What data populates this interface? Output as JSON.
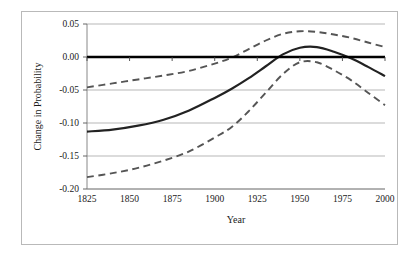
{
  "chart_data": {
    "type": "line",
    "title": "",
    "xlabel": "Year",
    "ylabel": "Change in Probability",
    "xlim": [
      1825,
      2000
    ],
    "ylim": [
      -0.2,
      0.05
    ],
    "grid": true,
    "legend": "none",
    "xticks": [
      1825,
      1850,
      1875,
      1900,
      1925,
      1950,
      1975,
      2000
    ],
    "xtick_labels": [
      "1825",
      "1850",
      "1875",
      "1900",
      "1925",
      "1950",
      "1975",
      "2000"
    ],
    "yticks": [
      0.05,
      0.0,
      -0.05,
      -0.1,
      -0.15,
      -0.2
    ],
    "ytick_labels": [
      "0.05",
      "0.00",
      "-0.05",
      "-0.10",
      "-0.15",
      "-0.20"
    ],
    "zero_reference_line": {
      "value": 0.0,
      "style": "solid-thick",
      "color": "#000000"
    },
    "x": [
      1825,
      1840,
      1855,
      1870,
      1885,
      1900,
      1910,
      1920,
      1930,
      1940,
      1950,
      1960,
      1970,
      1980,
      1990,
      2000
    ],
    "series": [
      {
        "name": "Upper confidence bound",
        "style": "dashed",
        "color": "#555555",
        "values": [
          -0.046,
          -0.04,
          -0.034,
          -0.028,
          -0.021,
          -0.01,
          -0.001,
          0.012,
          0.025,
          0.035,
          0.039,
          0.038,
          0.034,
          0.029,
          0.022,
          0.015
        ]
      },
      {
        "name": "Point estimate",
        "style": "solid",
        "color": "#222222",
        "values": [
          -0.113,
          -0.11,
          -0.104,
          -0.095,
          -0.081,
          -0.062,
          -0.048,
          -0.032,
          -0.014,
          0.004,
          0.014,
          0.015,
          0.008,
          -0.002,
          -0.015,
          -0.029
        ]
      },
      {
        "name": "Lower confidence bound",
        "style": "dashed",
        "color": "#555555",
        "values": [
          -0.182,
          -0.176,
          -0.168,
          -0.157,
          -0.143,
          -0.122,
          -0.106,
          -0.082,
          -0.054,
          -0.026,
          -0.008,
          -0.008,
          -0.02,
          -0.035,
          -0.054,
          -0.073
        ]
      }
    ]
  },
  "axes": {
    "x_title": "Year",
    "y_title": "Change in Probability"
  }
}
